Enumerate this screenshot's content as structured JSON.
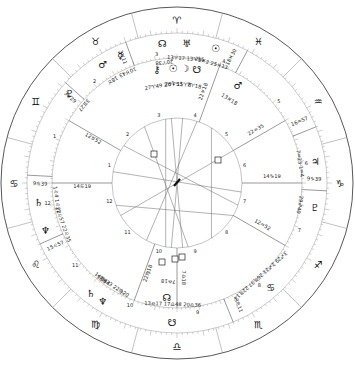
{
  "chart": {
    "type": "astrology-bi-wheel",
    "center": [
      177,
      183
    ],
    "radii": {
      "outer": 176,
      "zodiac_inner": 150,
      "middle": 125,
      "inner": 65
    },
    "colors": {
      "line": "#555555",
      "tick": "#888888",
      "aspect": "#666666",
      "text": "#222222"
    }
  },
  "zodiac_signs": [
    {
      "name": "aries",
      "glyph": "♈",
      "angle": 90
    },
    {
      "name": "pisces",
      "glyph": "♓",
      "angle": 60
    },
    {
      "name": "aquarius",
      "glyph": "♒",
      "angle": 30
    },
    {
      "name": "capricorn",
      "glyph": "♑",
      "angle": 0
    },
    {
      "name": "sagittarius",
      "glyph": "♐",
      "angle": -30
    },
    {
      "name": "scorpio",
      "glyph": "♏",
      "angle": -60
    },
    {
      "name": "libra",
      "glyph": "♎",
      "angle": -90
    },
    {
      "name": "virgo",
      "glyph": "♍",
      "angle": -120
    },
    {
      "name": "leo",
      "glyph": "♌",
      "angle": -150
    },
    {
      "name": "cancer",
      "glyph": "♋",
      "angle": 180
    },
    {
      "name": "gemini",
      "glyph": "♊",
      "angle": 150
    },
    {
      "name": "taurus",
      "glyph": "♉",
      "angle": 120
    }
  ],
  "outer_cusps": [
    {
      "label": "16♒57",
      "angle": 22
    },
    {
      "label": "9♑39",
      "angle": -3
    },
    {
      "label": "3♏11",
      "angle": -68
    },
    {
      "label": "15♌57",
      "angle": -156
    },
    {
      "label": "9♋39",
      "angle": 177
    },
    {
      "label": "3♉29",
      "angle": 138
    },
    {
      "label": "3♉11",
      "angle": 110
    },
    {
      "label": "18♓30",
      "angle": 62
    }
  ],
  "inner_cusps": [
    {
      "label": "14♑19",
      "angle": 0
    },
    {
      "label": "14♋19",
      "angle": 180
    },
    {
      "label": "22♓18",
      "angle": 70
    },
    {
      "label": "22♍18",
      "angle": -110
    },
    {
      "label": "12♒52",
      "angle": -30
    },
    {
      "label": "12♉52",
      "angle": 150
    },
    {
      "label": "22♒35",
      "angle": 30
    },
    {
      "label": "7♎18",
      "angle": -90
    }
  ],
  "outer_planets": [
    {
      "name": "north-node",
      "glyph": "☊",
      "pos": "20♈38",
      "angle": 96
    },
    {
      "name": "uranus",
      "glyph": "♅",
      "pos": "13♈17 13♈15",
      "angle": 86
    },
    {
      "name": "sun-venus",
      "glyph": "☉ ♀",
      "pos": "29♓2 25♓13",
      "angle": 74
    },
    {
      "name": "mars",
      "glyph": "♂",
      "pos": "18♉",
      "angle": 122
    },
    {
      "name": "mercury",
      "glyph": "☿",
      "pos": "10♉43",
      "angle": 114
    },
    {
      "name": "pluto",
      "glyph": "♇",
      "pos": "3♊27",
      "angle": 140
    },
    {
      "name": "saturn",
      "glyph": "♄",
      "pos": "1♌4 1♌22",
      "angle": -172
    },
    {
      "name": "neptune",
      "glyph": "♆",
      "pos": "21♌57 22♌35",
      "angle": -160
    },
    {
      "name": "saturn-2",
      "glyph": "♄",
      "pos": "14♍44",
      "angle": -128
    },
    {
      "name": "neptune-2",
      "glyph": "♆",
      "pos": "18♍33 22♍20",
      "angle": -122
    },
    {
      "name": "moon-node-s",
      "glyph": "☋",
      "pos": "13♎17 17♎48 20♎36",
      "angle": -92
    },
    {
      "name": "jupiter",
      "glyph": "♃",
      "pos": "7♒23 1♒4",
      "angle": 9
    },
    {
      "name": "pluto-2",
      "glyph": "♇",
      "pos": "29♐40",
      "angle": -10
    },
    {
      "name": "asc-group",
      "glyph": "♋ ☽ ♃",
      "pos": "3♐29 2♐21 26♏37 22♏14",
      "angle": -48
    }
  ],
  "inner_planets": [
    {
      "name": "south-node",
      "glyph": "☋",
      "pos": "7♈18",
      "angle": 80
    },
    {
      "name": "moon",
      "glyph": "☽",
      "pos": "15♈8",
      "angle": 86
    },
    {
      "name": "sun",
      "glyph": "☉",
      "pos": "20♈53",
      "angle": 92
    },
    {
      "name": "chiron",
      "glyph": "⚷",
      "pos": "27♈49 2♉1",
      "angle": 100
    },
    {
      "name": "mars-inner",
      "glyph": "♂",
      "pos": "13♓18",
      "angle": 58
    },
    {
      "name": "north-node-inner",
      "glyph": "☊",
      "pos": "7♎18",
      "angle": -95
    }
  ],
  "house_numbers": [
    "1",
    "2",
    "3",
    "4",
    "5",
    "6",
    "7",
    "8",
    "9",
    "10",
    "11",
    "12"
  ],
  "aspect_symbol": "□"
}
